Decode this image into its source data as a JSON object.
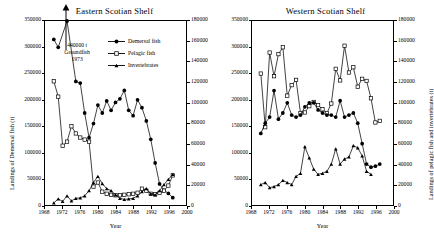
{
  "figure": {
    "xlabel": "Year",
    "ylabel_left": "Landings of Demersal fish (t)",
    "ylabel_right": "Landings of pelagic fish and invertebrates (t)",
    "xticks": [
      "1968",
      "1972",
      "1976",
      "1980",
      "1984",
      "1988",
      "1992",
      "1996",
      "2000"
    ],
    "yticks_left": [
      "0",
      "50000",
      "100000",
      "150000",
      "200000",
      "250000",
      "300000",
      "350000"
    ],
    "yticks_right": [
      "0",
      "20000",
      "40000",
      "60000",
      "80000",
      "100000",
      "120000",
      "140000",
      "160000",
      "180000"
    ],
    "legend": [
      {
        "label": "Demersal fish",
        "marker": "filled-circle",
        "color": "#000000"
      },
      {
        "label": "Pelagic fish",
        "marker": "open-square",
        "color": "#000000"
      },
      {
        "label": "Invertebrates",
        "marker": "filled-triangle",
        "color": "#000000"
      }
    ],
    "annotation": {
      "line1": "440000 t",
      "line2": "Groundfish",
      "line3": "1973"
    }
  },
  "chart_data": [
    {
      "type": "line",
      "title": "Eastern Scotian Shelf",
      "xlabel": "Year",
      "ylabel": "Landings of Demersal fish (t)",
      "ylabel_secondary": "Landings of pelagic fish and invertebrates (t)",
      "xlim": [
        1968,
        2000
      ],
      "ylim": [
        0,
        350000
      ],
      "ylim_secondary": [
        0,
        180000
      ],
      "grid": false,
      "legend_position": "top-center-right",
      "annotation": "440000 t Groundfish 1973",
      "x": [
        1970,
        1971,
        1972,
        1973,
        1974,
        1975,
        1976,
        1977,
        1978,
        1979,
        1980,
        1981,
        1982,
        1983,
        1984,
        1985,
        1986,
        1987,
        1988,
        1989,
        1990,
        1991,
        1992,
        1993,
        1994,
        1995,
        1996,
        1997
      ],
      "series": [
        {
          "name": "Demersal fish",
          "axis": "left",
          "marker": "filled-circle",
          "values": [
            315000,
            300000,
            null,
            440000,
            null,
            235000,
            232000,
            175000,
            128000,
            155000,
            190000,
            175000,
            198000,
            180000,
            195000,
            202000,
            218000,
            180000,
            170000,
            200000,
            185000,
            160000,
            125000,
            80000,
            40000,
            28000,
            22000,
            14000
          ]
        },
        {
          "name": "Pelagic fish",
          "axis": "right",
          "marker": "open-square",
          "values": [
            121000,
            106000,
            58000,
            62000,
            77000,
            70000,
            66000,
            64000,
            62000,
            18000,
            22000,
            13000,
            11000,
            10000,
            9500,
            9500,
            10000,
            10500,
            11000,
            12000,
            16000,
            14000,
            11000,
            10500,
            12000,
            14000,
            19000,
            29000
          ]
        },
        {
          "name": "Invertebrates",
          "axis": "right",
          "marker": "filled-triangle",
          "values": [
            2000,
            6000,
            3500,
            9000,
            4000,
            6500,
            7000,
            9000,
            14000,
            22000,
            28000,
            21000,
            16000,
            14000,
            10000,
            6500,
            5500,
            6000,
            6500,
            9000,
            13000,
            16000,
            11000,
            10000,
            14000,
            20000,
            25000,
            30000
          ]
        }
      ]
    },
    {
      "type": "line",
      "title": "Western Scotian Shelf",
      "xlabel": "Year",
      "ylabel": "Landings of Demersal fish (t)",
      "ylabel_secondary": "Landings of pelagic fish and invertebrates (t)",
      "xlim": [
        1968,
        2000
      ],
      "ylim": [
        0,
        350000
      ],
      "ylim_secondary": [
        0,
        180000
      ],
      "grid": false,
      "legend_position": "none",
      "x": [
        1970,
        1971,
        1972,
        1973,
        1974,
        1975,
        1976,
        1977,
        1978,
        1979,
        1980,
        1981,
        1982,
        1983,
        1984,
        1985,
        1986,
        1987,
        1988,
        1989,
        1990,
        1991,
        1992,
        1993,
        1994,
        1995,
        1996,
        1997
      ],
      "series": [
        {
          "name": "Pelagic fish",
          "axis": "left",
          "marker": "open-square",
          "values": [
            250000,
            148000,
            290000,
            245000,
            287000,
            300000,
            208000,
            228000,
            238000,
            175000,
            176000,
            188000,
            196000,
            190000,
            182000,
            175000,
            193000,
            259000,
            237000,
            303000,
            252000,
            262000,
            225000,
            240000,
            236000,
            203000,
            157000,
            160000
          ]
        },
        {
          "name": "Demersal fish",
          "axis": "right",
          "marker": "filled-circle",
          "values": [
            70000,
            80000,
            86000,
            112000,
            84000,
            90000,
            100000,
            88000,
            86000,
            88000,
            96000,
            100000,
            100000,
            93000,
            90000,
            88000,
            88000,
            86000,
            102000,
            86000,
            88000,
            90000,
            80000,
            60000,
            40000,
            37000,
            38000,
            40000
          ]
        },
        {
          "name": "Invertebrates",
          "axis": "right",
          "marker": "filled-triangle",
          "values": [
            20000,
            22000,
            17000,
            18000,
            20000,
            24000,
            22000,
            20000,
            28000,
            31000,
            57000,
            46000,
            35000,
            30000,
            31000,
            33000,
            40000,
            55000,
            40000,
            45000,
            47000,
            58000,
            56000,
            48000,
            33000,
            30000,
            null,
            null
          ]
        }
      ]
    }
  ]
}
